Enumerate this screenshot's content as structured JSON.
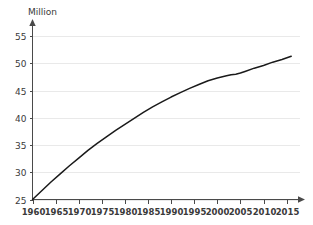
{
  "chart_data": {
    "type": "line",
    "title": "",
    "subtitle": "",
    "xlabel": "",
    "ylabel": "Million",
    "ylim": [
      25,
      56.5
    ],
    "xlim": [
      1960,
      2017
    ],
    "grid": true,
    "legend": false,
    "y_ticks": [
      25,
      30,
      35,
      40,
      45,
      50,
      55
    ],
    "x_ticks": [
      1960,
      1965,
      1970,
      1975,
      1980,
      1985,
      1990,
      1995,
      2000,
      2005,
      2010,
      2015
    ],
    "series": [
      {
        "name": "Population",
        "color": "#1a1a1a",
        "x": [
          1960,
          1962,
          1964,
          1966,
          1968,
          1970,
          1972,
          1974,
          1976,
          1978,
          1980,
          1982,
          1984,
          1986,
          1988,
          1990,
          1992,
          1994,
          1996,
          1998,
          2000,
          2002,
          2003,
          2004,
          2005,
          2006,
          2008,
          2010,
          2012,
          2014,
          2016
        ],
        "values": [
          25.0,
          26.6,
          28.2,
          29.7,
          31.2,
          32.6,
          34.0,
          35.3,
          36.5,
          37.7,
          38.8,
          39.9,
          41.0,
          42.0,
          42.9,
          43.8,
          44.6,
          45.4,
          46.1,
          46.8,
          47.3,
          47.7,
          47.9,
          48.0,
          48.2,
          48.5,
          49.1,
          49.6,
          50.2,
          50.7,
          51.3
        ]
      }
    ]
  },
  "axis": {
    "unit_label": "Million",
    "y_tick_labels": [
      "25",
      "30",
      "35",
      "40",
      "45",
      "50",
      "55"
    ],
    "x_tick_labels": [
      "1960",
      "1965",
      "1970",
      "1975",
      "1980",
      "1985",
      "1990",
      "1995",
      "2000",
      "2005",
      "2010",
      "2015"
    ]
  },
  "colors": {
    "background": "#ffffff",
    "gridline": "#e9e9e9",
    "axis": "#4a4a4a",
    "line": "#1a1a1a",
    "text": "#3a3a3a"
  }
}
